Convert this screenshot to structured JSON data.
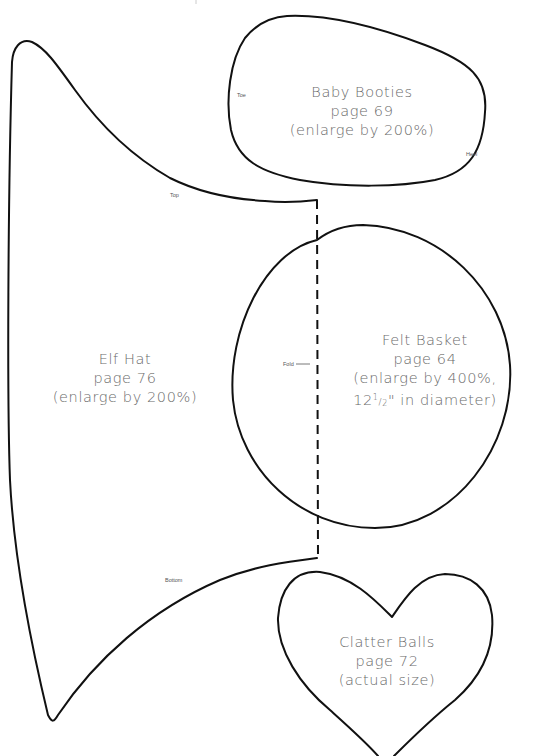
{
  "page": {
    "background": "#ffffff",
    "line_color": "#111111",
    "text_color": "#6a6a6a"
  },
  "patterns": {
    "baby_booties": {
      "name": "Baby Booties",
      "page": "page 69",
      "note": "(enlarge by 200%)",
      "marks": {
        "toe": "Toe",
        "heel": "Heel"
      }
    },
    "elf_hat": {
      "name": "Elf Hat",
      "page": "page 76",
      "note": "(enlarge by 200%)",
      "marks": {
        "top": "Top",
        "bottom": "Bottom",
        "fold": "Fold"
      }
    },
    "felt_basket": {
      "name": "Felt Basket",
      "page": "page 64",
      "note_line1": "(enlarge by 400%,",
      "note_line2_whole": "12",
      "note_line2_num": "1",
      "note_line2_den": "2",
      "note_line2_rest": "\" in diameter)"
    },
    "clatter_balls": {
      "name": "Clatter Balls",
      "page": "page 72",
      "note": "(actual size)"
    }
  }
}
